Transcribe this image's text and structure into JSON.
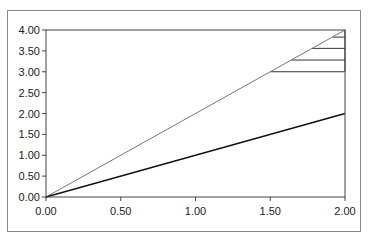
{
  "chart_data": {
    "type": "line",
    "title": "",
    "xlabel": "",
    "ylabel": "",
    "xlim": [
      0,
      2
    ],
    "ylim": [
      0,
      4
    ],
    "x_ticks": [
      "0.00",
      "0.50",
      "1.00",
      "1.50",
      "2.00"
    ],
    "y_ticks": [
      "0.00",
      "0.50",
      "1.00",
      "1.50",
      "2.00",
      "2.50",
      "3.00",
      "3.50",
      "4.00"
    ],
    "grid": false,
    "legend": "none",
    "series": [
      {
        "name": "y = 2x",
        "color": "#777777",
        "points": [
          [
            0,
            0
          ],
          [
            2,
            4
          ]
        ]
      },
      {
        "name": "y = x",
        "color": "#111111",
        "points": [
          [
            0,
            0
          ],
          [
            2,
            2
          ]
        ]
      }
    ],
    "horizontal_segments": [
      {
        "y": 3.0,
        "x_start": 1.5,
        "x_end": 2.0
      },
      {
        "y": 3.28,
        "x_start": 1.64,
        "x_end": 2.0
      },
      {
        "y": 3.56,
        "x_start": 1.78,
        "x_end": 2.0
      },
      {
        "y": 3.83,
        "x_start": 1.92,
        "x_end": 2.0
      }
    ]
  }
}
